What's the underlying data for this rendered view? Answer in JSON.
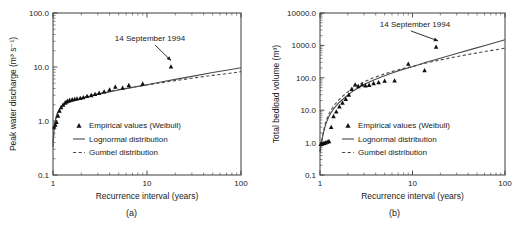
{
  "figure": {
    "panels": [
      {
        "id": "a",
        "caption": "(a)",
        "annotation": "14 September 1994",
        "legend": [
          {
            "key": "marker",
            "label": "Empirical values (Weibull)"
          },
          {
            "key": "solid",
            "label": "Lognormal distribution"
          },
          {
            "key": "dashed",
            "label": "Gumbel distribution"
          }
        ]
      },
      {
        "id": "b",
        "caption": "(b)",
        "annotation": "14 September 1994",
        "legend": [
          {
            "key": "marker",
            "label": "Empirical values (Weibull)"
          },
          {
            "key": "solid",
            "label": "Lognormal distribution"
          },
          {
            "key": "dashed",
            "label": "Gumbel distribution"
          }
        ]
      }
    ]
  },
  "chart_data": [
    {
      "type": "scatter",
      "panel": "a",
      "title": "",
      "xlabel": "Recurrence interval (years)",
      "ylabel": "Peak water discharge (m3 s-1)",
      "ylabel_display": "Peak water discharge (m³ s⁻¹)",
      "xscale": "log",
      "yscale": "log",
      "xlim": [
        1,
        100
      ],
      "ylim": [
        0.1,
        100.0
      ],
      "xticks": [
        1,
        10,
        100
      ],
      "xticklabels": [
        "1",
        "10",
        "100"
      ],
      "yticks": [
        0.1,
        1.0,
        10.0,
        100.0
      ],
      "yticklabels": [
        "0.1",
        "1.0",
        "10.0",
        "100.0"
      ],
      "grid": false,
      "legend_position": "lower right",
      "annotations": [
        {
          "text": "14 September 1994",
          "points_to_x": 18.0,
          "points_to_y": 10.2
        }
      ],
      "series": [
        {
          "name": "Empirical values (Weibull)",
          "type": "scatter",
          "marker": "triangle",
          "color": "#101010",
          "x": [
            1.03,
            1.06,
            1.09,
            1.13,
            1.17,
            1.22,
            1.28,
            1.35,
            1.42,
            1.5,
            1.6,
            1.7,
            1.8,
            1.95,
            2.1,
            2.3,
            2.55,
            2.8,
            3.1,
            3.5,
            4.0,
            4.6,
            5.5,
            6.4,
            9.0,
            18.0
          ],
          "y": [
            0.78,
            0.85,
            0.95,
            1.25,
            1.55,
            1.8,
            2.0,
            2.2,
            2.35,
            2.45,
            2.5,
            2.55,
            2.6,
            2.65,
            2.75,
            2.9,
            3.0,
            3.15,
            3.3,
            3.5,
            3.8,
            4.3,
            4.1,
            4.6,
            4.9,
            10.2
          ]
        },
        {
          "name": "Lognormal distribution",
          "type": "line",
          "style": "solid",
          "color": "#4a4a4a",
          "x": [
            1.0,
            1.02,
            1.05,
            1.1,
            1.2,
            1.35,
            1.5,
            1.8,
            2.2,
            2.8,
            3.5,
            5.0,
            7.0,
            10.0,
            15.0,
            20.0,
            30.0,
            50.0,
            70.0,
            100.0
          ],
          "y": [
            0.38,
            0.62,
            0.95,
            1.35,
            1.75,
            2.05,
            2.22,
            2.48,
            2.75,
            3.05,
            3.3,
            3.75,
            4.2,
            4.7,
            5.4,
            5.9,
            6.7,
            7.9,
            8.7,
            9.7
          ]
        },
        {
          "name": "Gumbel distribution",
          "type": "line",
          "style": "dashed",
          "color": "#4a4a4a",
          "x": [
            1.0,
            1.02,
            1.05,
            1.1,
            1.2,
            1.35,
            1.5,
            1.8,
            2.2,
            2.8,
            3.5,
            5.0,
            7.0,
            10.0,
            15.0,
            20.0,
            30.0,
            50.0,
            70.0,
            100.0
          ],
          "y": [
            0.33,
            0.58,
            0.92,
            1.32,
            1.74,
            2.06,
            2.24,
            2.52,
            2.8,
            3.12,
            3.38,
            3.82,
            4.22,
            4.65,
            5.2,
            5.6,
            6.2,
            7.0,
            7.5,
            8.2
          ]
        }
      ]
    },
    {
      "type": "scatter",
      "panel": "b",
      "title": "",
      "xlabel": "Recurrence interval (years)",
      "ylabel": "Total bedload volume (m3)",
      "ylabel_display": "Total bedload volume (m³)",
      "xscale": "log",
      "yscale": "log",
      "xlim": [
        1,
        100
      ],
      "ylim": [
        0.1,
        10000.0
      ],
      "xticks": [
        1,
        10,
        100
      ],
      "xticklabels": [
        "1",
        "10",
        "100"
      ],
      "yticks": [
        0.1,
        1.0,
        10.0,
        100.0,
        1000.0,
        10000.0
      ],
      "yticklabels": [
        "0.1",
        "1.0",
        "10.0",
        "100.0",
        "1000.0",
        "10000.0"
      ],
      "grid": false,
      "legend_position": "lower right",
      "annotations": [
        {
          "text": "14 September 1994",
          "points_to_x": 18.0,
          "points_to_y": 900.0
        }
      ],
      "series": [
        {
          "name": "Empirical values (Weibull)",
          "type": "scatter",
          "marker": "triangle",
          "color": "#101010",
          "x": [
            1.02,
            1.05,
            1.08,
            1.11,
            1.15,
            1.2,
            1.25,
            1.32,
            1.4,
            1.5,
            1.62,
            1.75,
            1.9,
            2.05,
            2.2,
            2.4,
            2.6,
            2.85,
            3.1,
            3.4,
            3.8,
            4.3,
            5.0,
            6.4,
            9.0,
            13.5,
            18.0
          ],
          "y": [
            0.9,
            0.92,
            0.95,
            0.97,
            1.0,
            1.05,
            1.1,
            3.0,
            6.5,
            9.0,
            13.0,
            17.0,
            22.0,
            30.0,
            45.0,
            62.0,
            55.0,
            62.0,
            58.0,
            60.0,
            68.0,
            72.0,
            80.0,
            82.0,
            270.0,
            170.0,
            900.0
          ]
        },
        {
          "name": "Lognormal distribution",
          "type": "line",
          "style": "solid",
          "color": "#4a4a4a",
          "x": [
            1.0,
            1.03,
            1.08,
            1.15,
            1.25,
            1.4,
            1.6,
            1.9,
            2.3,
            2.9,
            3.6,
            4.6,
            6.0,
            8.0,
            10.0,
            14.0,
            20.0,
            30.0,
            45.0,
            65.0,
            100.0
          ],
          "y": [
            0.55,
            0.9,
            1.8,
            3.6,
            6.5,
            11.0,
            17.0,
            26.0,
            40.0,
            60.0,
            80.0,
            105.0,
            140.0,
            185.0,
            220.0,
            300.0,
            400.0,
            560.0,
            780.0,
            1050.0,
            1500.0
          ]
        },
        {
          "name": "Gumbel distribution",
          "type": "line",
          "style": "dashed",
          "color": "#4a4a4a",
          "x": [
            1.0,
            1.03,
            1.08,
            1.15,
            1.25,
            1.4,
            1.6,
            1.9,
            2.3,
            2.9,
            3.6,
            4.6,
            6.0,
            8.0,
            10.0,
            14.0,
            20.0,
            30.0,
            45.0,
            65.0,
            100.0
          ],
          "y": [
            0.5,
            0.95,
            2.0,
            4.2,
            7.8,
            13.5,
            21.0,
            33.0,
            50.0,
            72.0,
            95.0,
            122.0,
            155.0,
            195.0,
            225.0,
            285.0,
            355.0,
            450.0,
            560.0,
            670.0,
            820.0
          ]
        }
      ]
    }
  ]
}
